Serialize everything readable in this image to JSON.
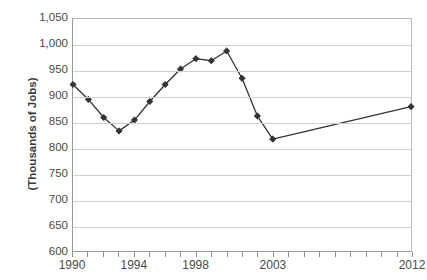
{
  "chart_data": {
    "type": "line",
    "title": "",
    "xlabel": "",
    "ylabel": "(Thousands of Jobs)",
    "ylim": [
      600,
      1050
    ],
    "ytick_step": 50,
    "yticks": [
      "600",
      "650",
      "700",
      "750",
      "800",
      "850",
      "900",
      "950",
      "1,000",
      "1,050"
    ],
    "ytick_values": [
      600,
      650,
      700,
      750,
      800,
      850,
      900,
      950,
      1000,
      1050
    ],
    "xlim": [
      1990,
      2012
    ],
    "xticks_labeled": [
      "1990",
      "1994",
      "1998",
      "2003",
      "2012"
    ],
    "xtick_label_values": [
      1990,
      1994,
      1998,
      2003,
      2012
    ],
    "xtick_all_values": [
      1990,
      1991,
      1992,
      1993,
      1994,
      1995,
      1996,
      1997,
      1998,
      1999,
      2000,
      2001,
      2002,
      2003,
      2004,
      2005,
      2006,
      2007,
      2008,
      2009,
      2010,
      2011,
      2012
    ],
    "grid": true,
    "legend": "none",
    "x": [
      1990,
      1991,
      1992,
      1993,
      1994,
      1995,
      1996,
      1997,
      1998,
      1999,
      2000,
      2001,
      2002,
      2003,
      2012
    ],
    "values": [
      923,
      894,
      859,
      833,
      854,
      890,
      923,
      953,
      973,
      969,
      988,
      935,
      862,
      817,
      880
    ],
    "series": [
      {
        "name": "Jobs",
        "color": "#333333",
        "marker": "diamond",
        "values": [
          923,
          894,
          859,
          833,
          854,
          890,
          923,
          953,
          973,
          969,
          988,
          935,
          862,
          817,
          880
        ]
      }
    ]
  },
  "axes": {
    "y_axis_label": "(Thousands of Jobs)"
  },
  "title_fragment": {
    "text": "",
    "note": "top of chart title is cropped off above the image frame"
  },
  "colors": {
    "series_line": "#333333",
    "marker": "#2b2b2b",
    "gridline": "#cfcfcf",
    "axis": "#9a9a9a",
    "tick_text": "#4a4a4a",
    "label_text": "#3a3a3a",
    "background": "#ffffff"
  }
}
